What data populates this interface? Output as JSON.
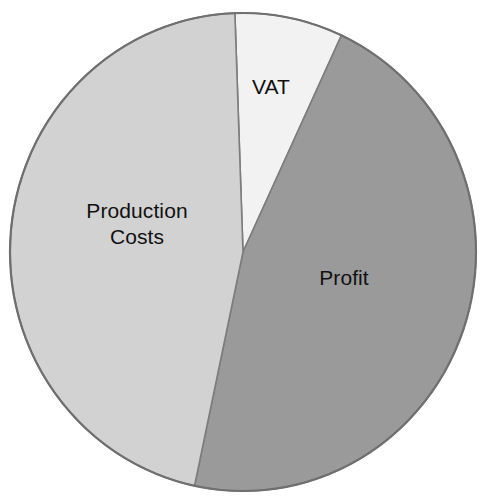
{
  "chart_data": {
    "type": "pie",
    "title": "",
    "subtitle": "",
    "xlabel": "",
    "ylabel": "",
    "legend_position": "none",
    "grid": false,
    "labels_inside_slices": true,
    "start_angle_deg": -2,
    "direction": "clockwise",
    "categories": [
      "VAT",
      "Profit",
      "Production Costs"
    ],
    "values": [
      7.5,
      46.5,
      46
    ],
    "units": "percent",
    "slices": [
      {
        "name": "VAT",
        "label": "VAT",
        "value": 7.5,
        "start_angle_deg": -2,
        "end_angle_deg": 25,
        "color": "#f2f2f2"
      },
      {
        "name": "Profit",
        "label": "Profit",
        "value": 46.5,
        "start_angle_deg": 25,
        "end_angle_deg": 192,
        "color": "#9a9a9a"
      },
      {
        "name": "Production Costs",
        "label": "Production\nCosts",
        "value": 46,
        "start_angle_deg": 192,
        "end_angle_deg": 358,
        "color": "#d2d2d2"
      }
    ],
    "colors": {
      "vat": "#f2f2f2",
      "profit": "#9a9a9a",
      "production_costs": "#d2d2d2",
      "outline": "#6f6f6f",
      "divider": "#7d7d7d",
      "label_text": "#111111",
      "background": "#ffffff"
    },
    "geometry": {
      "center_x": 243,
      "center_y": 252,
      "radius_x": 233,
      "radius_y": 239
    }
  }
}
